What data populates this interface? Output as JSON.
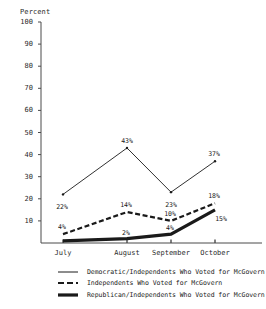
{
  "chart_data": {
    "type": "line",
    "title": "",
    "ylabel": "Percent",
    "xlabel": "",
    "categories": [
      "July",
      "August",
      "September",
      "October"
    ],
    "ylim": [
      0,
      100
    ],
    "ytick_values": [
      0,
      10,
      20,
      30,
      40,
      50,
      60,
      70,
      80,
      90,
      100
    ],
    "ytick_labels": [
      "",
      "10",
      "20",
      "30",
      "40",
      "50",
      "60",
      "70",
      "80",
      "90",
      "100"
    ],
    "grid": false,
    "legend_position": "bottom",
    "series": [
      {
        "name": "Democratic/Independents Who Voted for McGovern",
        "style": "solid-thin",
        "values": [
          22,
          43,
          23,
          37
        ],
        "labels": [
          "22%",
          "43%",
          "23%",
          "37%"
        ]
      },
      {
        "name": "Independents Who Voted for McGovern",
        "style": "dashed",
        "values": [
          4,
          14,
          10,
          18
        ],
        "labels": [
          "4%",
          "14%",
          "10%",
          "18%"
        ]
      },
      {
        "name": "Republican/Independents Who Voted for McGovern",
        "style": "solid-thick",
        "values": [
          1,
          2,
          4,
          15
        ],
        "labels": [
          "",
          "2%",
          "4%",
          "15%"
        ]
      }
    ]
  },
  "axis": {
    "percent_title": "Percent"
  },
  "legend": {
    "items": [
      {
        "label": "Democratic/Independents Who Voted for McGovern"
      },
      {
        "label": "Independents Who Voted for McGovern"
      },
      {
        "label": "Republican/Independents Who Voted for McGovern"
      }
    ]
  },
  "colors": {
    "ink": "#1a1a1a",
    "axis": "#4a4a4a",
    "background": "#ffffff"
  }
}
